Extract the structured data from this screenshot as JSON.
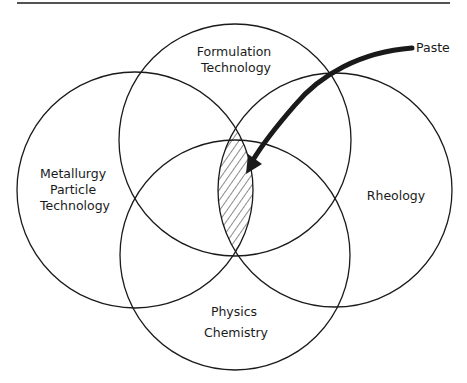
{
  "diagram": {
    "type": "venn",
    "title": "",
    "colors": {
      "stroke": "#1a1a1a",
      "background": "#ffffff",
      "hatch": "#1a1a1a"
    },
    "sets": [
      {
        "id": "top",
        "lines": [
          "Formulation",
          "Technology"
        ]
      },
      {
        "id": "left",
        "lines": [
          "Metallurgy",
          "Particle",
          "Technology"
        ]
      },
      {
        "id": "right",
        "lines": [
          "Rheology"
        ]
      },
      {
        "id": "bottom",
        "lines": [
          "Physics",
          "Chemistry"
        ]
      }
    ],
    "highlighted_region": {
      "description": "Intersection of all four disciplines (hatched)",
      "pattern": "diagonal-hatch"
    },
    "annotation": {
      "label": "Paste",
      "points_to": "highlighted_region"
    }
  }
}
